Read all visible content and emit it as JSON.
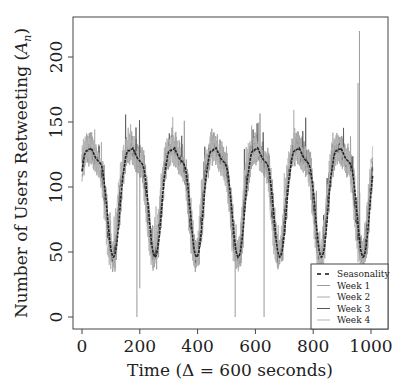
{
  "chart_data": {
    "type": "line",
    "title": "",
    "xlabel": "Time (Δ = 600 seconds)",
    "ylabel": "Number of Users Retweeting (A_n)",
    "xlim": [
      0,
      1008
    ],
    "ylim": [
      -8,
      228
    ],
    "xticks": [
      0,
      200,
      400,
      600,
      800,
      1000
    ],
    "yticks": [
      0,
      50,
      100,
      150,
      200
    ],
    "grid": false,
    "legend_position": "lower right",
    "period": 144,
    "seasonality_profile": [
      112,
      118,
      124,
      127,
      128,
      128,
      129,
      129,
      130,
      128,
      126,
      124,
      122,
      121,
      120,
      119,
      118,
      116,
      112,
      105,
      97,
      88,
      78,
      68,
      59,
      52,
      48,
      46,
      47,
      50,
      56,
      64,
      74,
      85,
      96,
      106
    ],
    "series": [
      {
        "name": "Seasonality",
        "style": "dashed",
        "color": "#111111"
      },
      {
        "name": "Week 1",
        "style": "solid",
        "color": "#9a9a9a",
        "noise": 14,
        "seed": 3
      },
      {
        "name": "Week 2",
        "style": "solid",
        "color": "#aaaaaa",
        "noise": 12,
        "seed": 7
      },
      {
        "name": "Week 3",
        "style": "solid",
        "color": "#555555",
        "noise": 5,
        "seed": 11
      },
      {
        "name": "Week 4",
        "style": "solid",
        "color": "#b5b5b5",
        "noise": 10,
        "seed": 19
      }
    ],
    "spikes": [
      {
        "x": 190,
        "y": 0
      },
      {
        "x": 200,
        "y": 22
      },
      {
        "x": 530,
        "y": 0
      },
      {
        "x": 630,
        "y": 0
      },
      {
        "x": 960,
        "y": 220
      },
      {
        "x": 955,
        "y": 180
      }
    ]
  },
  "legend": {
    "items": [
      "Seasonality",
      "Week 1",
      "Week 2",
      "Week 3",
      "Week 4"
    ]
  },
  "axes": {
    "xlabel": "Time (Δ = 600 seconds)",
    "ylabel_prefix": "Number of Users Retweeting (",
    "ylabel_var": "A",
    "ylabel_sub": "n",
    "ylabel_suffix": ")"
  }
}
